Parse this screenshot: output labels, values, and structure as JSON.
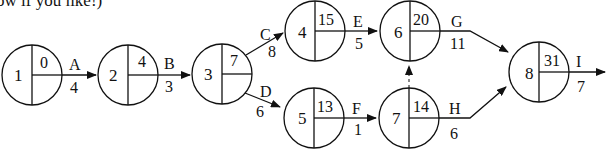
{
  "caption": "ow if you like!)",
  "nodes": [
    {
      "id": "1",
      "earliest": "0",
      "cx": 32,
      "cy": 75
    },
    {
      "id": "2",
      "earliest": "4",
      "cx": 128,
      "cy": 75
    },
    {
      "id": "3",
      "earliest": "7",
      "cx": 222,
      "cy": 74
    },
    {
      "id": "4",
      "earliest": "15",
      "cx": 315,
      "cy": 31
    },
    {
      "id": "5",
      "earliest": "13",
      "cx": 314,
      "cy": 118
    },
    {
      "id": "6",
      "earliest": "20",
      "cx": 410,
      "cy": 31
    },
    {
      "id": "7",
      "earliest": "14",
      "cx": 409,
      "cy": 118
    },
    {
      "id": "8",
      "earliest": "31",
      "cx": 539,
      "cy": 73
    }
  ],
  "activities": [
    {
      "label": "A",
      "duration": "4",
      "from": "1",
      "to": "2"
    },
    {
      "label": "B",
      "duration": "3",
      "from": "2",
      "to": "3"
    },
    {
      "label": "C",
      "duration": "8",
      "from": "3",
      "to": "4"
    },
    {
      "label": "D",
      "duration": "6",
      "from": "3",
      "to": "5"
    },
    {
      "label": "E",
      "duration": "5",
      "from": "4",
      "to": "6"
    },
    {
      "label": "F",
      "duration": "1",
      "from": "5",
      "to": "7"
    },
    {
      "label": "G",
      "duration": "11",
      "from": "6",
      "to": "8"
    },
    {
      "label": "H",
      "duration": "6",
      "from": "7",
      "to": "8"
    },
    {
      "label": "I",
      "duration": "7",
      "from": "8",
      "to": "end"
    }
  ],
  "dummy": {
    "from": "7",
    "to": "6",
    "style": "dashed"
  }
}
